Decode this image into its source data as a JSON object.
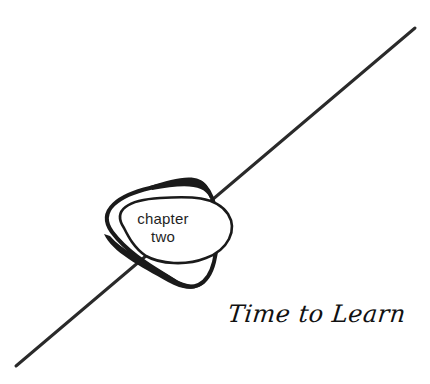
{
  "chapter": {
    "word": "chapter",
    "number": "two"
  },
  "title": "Time to Learn",
  "colors": {
    "ink": "#1a1a1a",
    "background": "#ffffff"
  }
}
